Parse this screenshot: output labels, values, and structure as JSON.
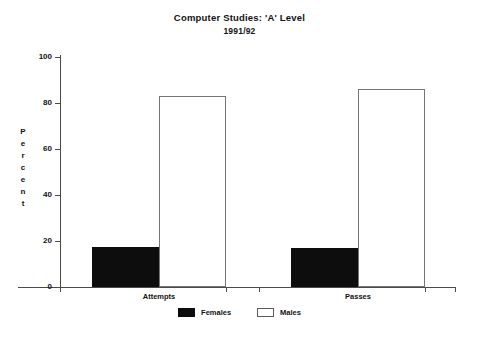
{
  "chart_data": {
    "type": "bar",
    "title": "Computer Studies: 'A' Level",
    "subtitle": "1991/92",
    "xlabel": "",
    "ylabel": "Percent",
    "ylim": [
      0,
      100
    ],
    "yticks": [
      0,
      20,
      40,
      60,
      80,
      100
    ],
    "ytick_labels": [
      "0",
      "20",
      "40",
      "60",
      "80",
      "100"
    ],
    "grid": false,
    "legend_position": "bottom-center",
    "categories": [
      "Attempts",
      "Passes"
    ],
    "series": [
      {
        "name": "Females",
        "color": "#0d0d0d",
        "values": [
          17.5,
          17
        ]
      },
      {
        "name": "Males",
        "color": "#ffffff",
        "values": [
          83,
          86
        ]
      }
    ]
  },
  "legend": {
    "items": [
      {
        "label": "Females"
      },
      {
        "label": "Males"
      }
    ]
  },
  "axis": {
    "y_title_letters": [
      "P",
      "e",
      "r",
      "c",
      "e",
      "n",
      "t"
    ]
  }
}
